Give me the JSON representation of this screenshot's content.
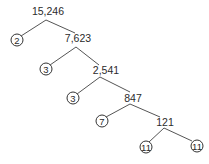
{
  "diagram": {
    "type": "factor-tree",
    "line_color": "#555555",
    "text_color": "#2b2b2b",
    "composites": [
      {
        "label": "15,246",
        "x": 48,
        "y": 6
      },
      {
        "label": "7,623",
        "x": 78,
        "y": 33
      },
      {
        "label": "2,541",
        "x": 106,
        "y": 65
      },
      {
        "label": "847",
        "x": 133,
        "y": 93
      },
      {
        "label": "121",
        "x": 165,
        "y": 117
      }
    ],
    "primes": [
      {
        "label": "2",
        "x": 17,
        "y": 40
      },
      {
        "label": "3",
        "x": 46,
        "y": 69
      },
      {
        "label": "3",
        "x": 73,
        "y": 98
      },
      {
        "label": "7",
        "x": 102,
        "y": 121
      },
      {
        "label": "11",
        "x": 146,
        "y": 147
      },
      {
        "label": "11",
        "x": 197,
        "y": 146
      }
    ],
    "edges": [
      [
        46,
        20,
        21,
        36
      ],
      [
        46,
        20,
        75,
        33
      ],
      [
        76,
        47,
        50,
        65
      ],
      [
        76,
        47,
        99,
        65
      ],
      [
        100,
        77,
        77,
        94
      ],
      [
        100,
        77,
        130,
        92
      ],
      [
        130,
        104,
        106,
        117
      ],
      [
        130,
        104,
        160,
        117
      ],
      [
        164,
        128,
        149,
        142
      ],
      [
        164,
        128,
        192,
        141
      ]
    ]
  }
}
